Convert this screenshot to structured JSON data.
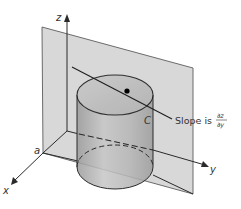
{
  "figure": {
    "type": "3d-partial-derivative-diagram",
    "axes": {
      "x_label": "x",
      "y_label": "y",
      "z_label": "z"
    },
    "point_label": "a",
    "curve_label": "C",
    "annotation": {
      "prefix": "Slope is",
      "numerator": "∂z",
      "denominator": "∂y"
    },
    "colors": {
      "plane": "#d4d4d4",
      "plane_edge": "#5a5a5a",
      "cylinder_fill": "#c8c8c8",
      "line": "#2a2a2a",
      "background": "#ffffff"
    }
  }
}
